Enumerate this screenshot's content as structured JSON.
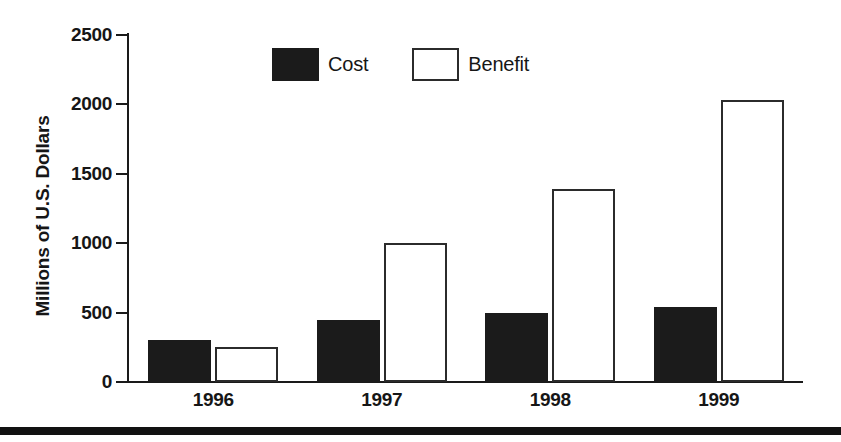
{
  "chart_data": {
    "type": "bar",
    "title": "",
    "subtitle": "",
    "xlabel": "",
    "ylabel": "Millions of U.S. Dollars",
    "categories": [
      "1996",
      "1997",
      "1998",
      "1999"
    ],
    "series": [
      {
        "name": "Cost",
        "color": "#1b1b1b",
        "fill": "solid-black",
        "values": [
          300,
          450,
          495,
          540
        ]
      },
      {
        "name": "Benefit",
        "color": "#ffffff",
        "fill": "white-outlined",
        "values": [
          250,
          1000,
          1390,
          2030
        ]
      }
    ],
    "ylim": [
      0,
      2500
    ],
    "yticks": [
      0,
      500,
      1000,
      1500,
      2000,
      2500
    ],
    "ytick_labels": [
      "0",
      "500",
      "1000",
      "1500",
      "2000",
      "2500"
    ],
    "grid": false,
    "legend_position": "top-center",
    "legend_entries": [
      "Cost",
      "Benefit"
    ]
  },
  "axis": {
    "y_title": "Millions of U.S. Dollars",
    "ticks": [
      {
        "label": "2500",
        "value": 2500
      },
      {
        "label": "2000",
        "value": 2000
      },
      {
        "label": "1500",
        "value": 1500
      },
      {
        "label": "1000",
        "value": 1000
      },
      {
        "label": "500",
        "value": 500
      },
      {
        "label": "0",
        "value": 0
      }
    ]
  },
  "legend": {
    "cost_label": "Cost",
    "benefit_label": "Benefit"
  },
  "categories": [
    {
      "label": "1996"
    },
    {
      "label": "1997"
    },
    {
      "label": "1998"
    },
    {
      "label": "1999"
    }
  ]
}
